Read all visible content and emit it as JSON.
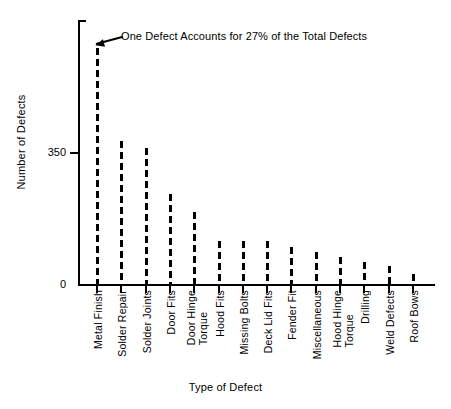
{
  "chart_data": {
    "type": "bar",
    "title": "",
    "xlabel": "Type of Defect",
    "ylabel": "Number of Defects",
    "ylim": [
      0,
      700
    ],
    "grid": false,
    "legend": null,
    "ytick_values": [
      0,
      350
    ],
    "ytick_labels": [
      "0",
      "350"
    ],
    "categories": [
      "Metal Finish",
      "Solder Repair",
      "Solder Joints",
      "Door Fits",
      "Door Hinge\nTorque",
      "Hood Fits",
      "Missing Bolts",
      "Deck Lid Fits",
      "Fender Fit",
      "Miscellaneous",
      "Hood Hinge\nTorque",
      "Drilling",
      "Weld Defects",
      "Roof Bows"
    ],
    "values": [
      625,
      378,
      360,
      239,
      192,
      113,
      113,
      113,
      97,
      84,
      71,
      58,
      47,
      26
    ],
    "annotations": [
      {
        "text": "One Defect Accounts for 27% of the Total Defects",
        "points_to_category": "Metal Finish"
      }
    ]
  },
  "axes": {
    "y_title": "Number of Defects",
    "x_title": "Type of Defect"
  },
  "style": {
    "axis_color": "#000000",
    "bar_color": "#000000",
    "background": "#ffffff"
  }
}
